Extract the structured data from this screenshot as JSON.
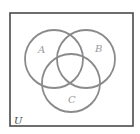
{
  "diagram": {
    "type": "venn",
    "universe": {
      "label": "U",
      "frame": {
        "x": 10,
        "y": 13,
        "width": 123,
        "height": 113
      },
      "label_pos": {
        "x": 14,
        "y": 124
      }
    },
    "sets": [
      {
        "id": "A",
        "label": "A",
        "cx": 54,
        "cy": 59,
        "r": 29,
        "label_pos": {
          "x": 38,
          "y": 53
        }
      },
      {
        "id": "B",
        "label": "B",
        "cx": 86,
        "cy": 59,
        "r": 29,
        "label_pos": {
          "x": 95,
          "y": 52
        }
      },
      {
        "id": "C",
        "label": "C",
        "cx": 71,
        "cy": 83,
        "r": 29,
        "label_pos": {
          "x": 68,
          "y": 103
        }
      }
    ],
    "colors": {
      "frame": "#4a4a4a",
      "circle_stroke": "#8a8a8a",
      "set_label": "#9a9a9a",
      "universe_label": "#444444",
      "background": "#ffffff"
    }
  }
}
